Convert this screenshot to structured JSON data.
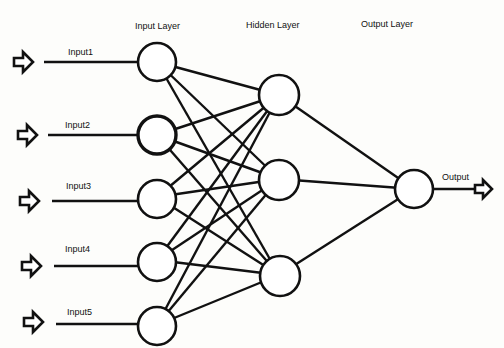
{
  "layers": {
    "input": "Input Layer",
    "hidden": "Hidden Layer",
    "output": "Output Layer"
  },
  "inputs": [
    "Input1",
    "Input2",
    "Input3",
    "Input4",
    "Input5"
  ],
  "output_label": "Output",
  "colors": {
    "line": "#111111",
    "background": "#fdfdfb",
    "node_fill": "#ffffff"
  }
}
